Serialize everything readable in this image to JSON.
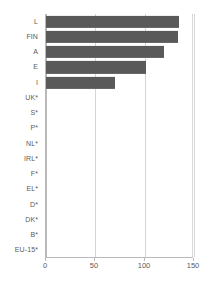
{
  "chart_data": {
    "type": "bar",
    "orientation": "horizontal",
    "title": "",
    "subtitle": "",
    "xlabel": "",
    "ylabel": "",
    "categories": [
      "L",
      "FIN",
      "A",
      "E",
      "I",
      "UK*",
      "S*",
      "P*",
      "NL*",
      "IRL*",
      "F*",
      "EL*",
      "D*",
      "DK*",
      "B*",
      "EU-15*"
    ],
    "values": [
      135,
      134,
      120,
      101,
      70,
      0,
      0,
      0,
      0,
      0,
      0,
      0,
      0,
      0,
      0,
      0
    ],
    "xlim": [
      0,
      150
    ],
    "xticks": [
      0,
      50,
      100,
      150
    ],
    "xtick_labels": [
      "0",
      "50",
      "100",
      "150"
    ],
    "grid": true,
    "grid_axis": "x",
    "legend": false,
    "legend_position": "none",
    "bar_color": "#595959",
    "gridline_color": "#d5d5d5",
    "axis_color": "#b9b9b9",
    "label_color": "#5a5a5a",
    "background_color": "#ffffff"
  }
}
